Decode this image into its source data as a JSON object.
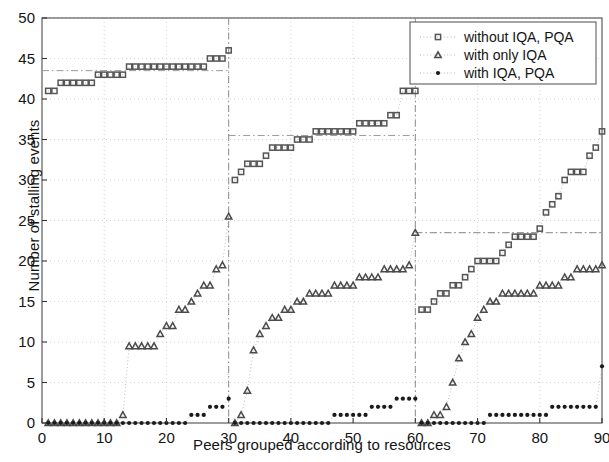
{
  "chart_data": {
    "type": "scatter",
    "title": "",
    "xlabel": "Peers grouped according to resources",
    "ylabel": "Number of stalling events",
    "xlim": [
      0,
      90
    ],
    "ylim": [
      0,
      50
    ],
    "xticks": [
      0,
      10,
      20,
      30,
      40,
      50,
      60,
      70,
      80,
      90
    ],
    "yticks": [
      0,
      5,
      10,
      15,
      20,
      25,
      30,
      35,
      40,
      45,
      50
    ],
    "grid": true,
    "grid_style": "dotted",
    "legend_position": "top-right",
    "group_boundaries": [
      30,
      60
    ],
    "series": [
      {
        "name": "without IQA, PQA",
        "marker": "square",
        "color": "#555555",
        "mean_levels": [
          43.5,
          35.5,
          23.5
        ],
        "x": [
          1,
          2,
          3,
          4,
          5,
          6,
          7,
          8,
          9,
          10,
          11,
          12,
          13,
          14,
          15,
          16,
          17,
          18,
          19,
          20,
          21,
          22,
          23,
          24,
          25,
          26,
          27,
          28,
          29,
          30,
          31,
          32,
          33,
          34,
          35,
          36,
          37,
          38,
          39,
          40,
          41,
          42,
          43,
          44,
          45,
          46,
          47,
          48,
          49,
          50,
          51,
          52,
          53,
          54,
          55,
          56,
          57,
          58,
          59,
          60,
          61,
          62,
          63,
          64,
          65,
          66,
          67,
          68,
          69,
          70,
          71,
          72,
          73,
          74,
          75,
          76,
          77,
          78,
          79,
          80,
          81,
          82,
          83,
          84,
          85,
          86,
          87,
          88,
          89,
          90
        ],
        "y": [
          41,
          41,
          42,
          42,
          42,
          42,
          42,
          42,
          43,
          43,
          43,
          43,
          43,
          44,
          44,
          44,
          44,
          44,
          44,
          44,
          44,
          44,
          44,
          44,
          44,
          44,
          45,
          45,
          45,
          46,
          30,
          31,
          32,
          32,
          32,
          33,
          34,
          34,
          34,
          34,
          35,
          35,
          35,
          36,
          36,
          36,
          36,
          36,
          36,
          36,
          37,
          37,
          37,
          37,
          37,
          38,
          38,
          41,
          41,
          41,
          14,
          14,
          15,
          16,
          16,
          17,
          17,
          18,
          19,
          20,
          20,
          20,
          20,
          21,
          22,
          23,
          23,
          23,
          23,
          24,
          26,
          27,
          28,
          30,
          31,
          31,
          31,
          33,
          34,
          36
        ]
      },
      {
        "name": "with only IQA",
        "marker": "triangle",
        "color": "#4a4a4a",
        "x": [
          1,
          2,
          3,
          4,
          5,
          6,
          7,
          8,
          9,
          10,
          11,
          12,
          13,
          14,
          15,
          16,
          17,
          18,
          19,
          20,
          21,
          22,
          23,
          24,
          25,
          26,
          27,
          28,
          29,
          30,
          31,
          32,
          33,
          34,
          35,
          36,
          37,
          38,
          39,
          40,
          41,
          42,
          43,
          44,
          45,
          46,
          47,
          48,
          49,
          50,
          51,
          52,
          53,
          54,
          55,
          56,
          57,
          58,
          59,
          60,
          61,
          62,
          63,
          64,
          65,
          66,
          67,
          68,
          69,
          70,
          71,
          72,
          73,
          74,
          75,
          76,
          77,
          78,
          79,
          80,
          81,
          82,
          83,
          84,
          85,
          86,
          87,
          88,
          89,
          90
        ],
        "y": [
          0,
          0,
          0,
          0,
          0,
          0,
          0,
          0,
          0,
          0,
          0,
          0,
          1,
          9.5,
          9.5,
          9.5,
          9.5,
          9.5,
          11,
          12,
          12,
          14,
          14,
          15,
          16,
          17,
          17,
          19,
          19.5,
          25.5,
          0,
          1,
          4,
          9,
          11,
          12,
          13,
          13,
          14,
          14,
          15,
          15,
          16,
          16,
          16,
          16,
          17,
          17,
          17,
          17,
          18,
          18,
          18,
          18,
          19,
          19,
          19,
          19,
          19.5,
          23.5,
          0,
          0,
          1,
          1,
          2,
          5,
          8,
          10,
          11,
          13,
          14,
          15,
          15,
          16,
          16,
          16,
          16,
          16,
          16,
          17,
          17,
          17,
          17,
          18,
          18,
          19,
          19,
          19,
          19,
          19.5
        ]
      },
      {
        "name": "with IQA, PQA",
        "marker": "dot",
        "color": "#1a1a1a",
        "x": [
          1,
          2,
          3,
          4,
          5,
          6,
          7,
          8,
          9,
          10,
          11,
          12,
          13,
          14,
          15,
          16,
          17,
          18,
          19,
          20,
          21,
          22,
          23,
          24,
          25,
          26,
          27,
          28,
          29,
          30,
          31,
          32,
          33,
          34,
          35,
          36,
          37,
          38,
          39,
          40,
          41,
          42,
          43,
          44,
          45,
          46,
          47,
          48,
          49,
          50,
          51,
          52,
          53,
          54,
          55,
          56,
          57,
          58,
          59,
          60,
          61,
          62,
          63,
          64,
          65,
          66,
          67,
          68,
          69,
          70,
          71,
          72,
          73,
          74,
          75,
          76,
          77,
          78,
          79,
          80,
          81,
          82,
          83,
          84,
          85,
          86,
          87,
          88,
          89,
          90
        ],
        "y": [
          0,
          0,
          0,
          0,
          0,
          0,
          0,
          0,
          0,
          0,
          0,
          0,
          0,
          0,
          0,
          0,
          0,
          0,
          0,
          0,
          0,
          0,
          0,
          1,
          1,
          1,
          2,
          2,
          2,
          3,
          0,
          0,
          0,
          0,
          0,
          0,
          0,
          0,
          0,
          0,
          0,
          0,
          0,
          0,
          0,
          0,
          1,
          1,
          1,
          1,
          1,
          1,
          2,
          2,
          2,
          2,
          3,
          3,
          3,
          3,
          0,
          0,
          0,
          0,
          0,
          0,
          0,
          0,
          0,
          0,
          0,
          1,
          1,
          1,
          1,
          1,
          1,
          1,
          1,
          1,
          1,
          2,
          2,
          2,
          2,
          2,
          2,
          2,
          2,
          7
        ]
      }
    ]
  },
  "legend": {
    "items": [
      {
        "label": "without IQA, PQA",
        "marker": "square"
      },
      {
        "label": "with only IQA",
        "marker": "triangle"
      },
      {
        "label": "with IQA, PQA",
        "marker": "dot"
      }
    ]
  }
}
